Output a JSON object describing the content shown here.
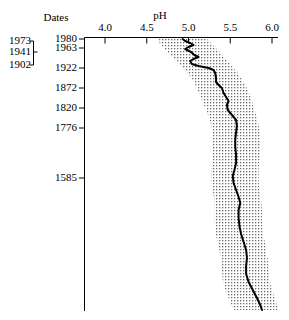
{
  "figure": {
    "dates_header": "Dates",
    "ph_axis_title": "pH"
  },
  "chart_data": {
    "type": "line",
    "title": "pH",
    "xlabel": "pH",
    "ylabel": "Dates",
    "xlim": [
      3.8,
      6.1
    ],
    "ylim_depth_px": [
      37,
      311
    ],
    "grid": false,
    "legend": null,
    "x_ticks": [
      4.0,
      4.5,
      5.0,
      5.5,
      6.0
    ],
    "x_tick_labels": [
      "4.0",
      "4.5",
      "5.0",
      "5.5",
      "6.0"
    ],
    "y_tick_labels": [
      "1980",
      "1963",
      "1922",
      "1872",
      "1820",
      "1776",
      "1585"
    ],
    "y_tick_positions_px": [
      39,
      48,
      68,
      88,
      108,
      128,
      178
    ],
    "bracket_labels": [
      "1973",
      "1941",
      "1902"
    ],
    "bracket_label_positions_px": [
      41,
      52,
      65
    ],
    "series": [
      {
        "name": "reconstructed pH",
        "points": [
          [
            4.93,
            39
          ],
          [
            4.96,
            41
          ],
          [
            5.02,
            43
          ],
          [
            5.06,
            45
          ],
          [
            5.0,
            47
          ],
          [
            4.96,
            49
          ],
          [
            5.03,
            52
          ],
          [
            5.07,
            55
          ],
          [
            5.12,
            57
          ],
          [
            5.06,
            59
          ],
          [
            5.02,
            61
          ],
          [
            5.04,
            64
          ],
          [
            5.12,
            66
          ],
          [
            5.24,
            68
          ],
          [
            5.3,
            70
          ],
          [
            5.32,
            73
          ],
          [
            5.33,
            78
          ],
          [
            5.33,
            82
          ],
          [
            5.36,
            85
          ],
          [
            5.4,
            88
          ],
          [
            5.42,
            93
          ],
          [
            5.45,
            97
          ],
          [
            5.48,
            101
          ],
          [
            5.46,
            105
          ],
          [
            5.47,
            110
          ],
          [
            5.52,
            115
          ],
          [
            5.57,
            120
          ],
          [
            5.58,
            126
          ],
          [
            5.57,
            132
          ],
          [
            5.56,
            139
          ],
          [
            5.56,
            147
          ],
          [
            5.57,
            155
          ],
          [
            5.57,
            163
          ],
          [
            5.55,
            170
          ],
          [
            5.53,
            176
          ],
          [
            5.54,
            183
          ],
          [
            5.57,
            190
          ],
          [
            5.6,
            197
          ],
          [
            5.62,
            203
          ],
          [
            5.6,
            210
          ],
          [
            5.6,
            218
          ],
          [
            5.61,
            226
          ],
          [
            5.63,
            234
          ],
          [
            5.66,
            242
          ],
          [
            5.69,
            250
          ],
          [
            5.7,
            258
          ],
          [
            5.69,
            266
          ],
          [
            5.69,
            274
          ],
          [
            5.72,
            282
          ],
          [
            5.77,
            290
          ],
          [
            5.82,
            298
          ],
          [
            5.86,
            305
          ],
          [
            5.88,
            310
          ]
        ]
      }
    ],
    "band": {
      "name": "error band",
      "lower": [
        [
          4.63,
          39
        ],
        [
          4.66,
          44
        ],
        [
          4.72,
          50
        ],
        [
          4.8,
          56
        ],
        [
          4.86,
          62
        ],
        [
          4.94,
          68
        ],
        [
          5.0,
          74
        ],
        [
          5.06,
          81
        ],
        [
          5.1,
          88
        ],
        [
          5.14,
          96
        ],
        [
          5.18,
          104
        ],
        [
          5.22,
          112
        ],
        [
          5.26,
          121
        ],
        [
          5.28,
          130
        ],
        [
          5.29,
          140
        ],
        [
          5.29,
          150
        ],
        [
          5.28,
          160
        ],
        [
          5.27,
          170
        ],
        [
          5.27,
          180
        ],
        [
          5.29,
          190
        ],
        [
          5.31,
          200
        ],
        [
          5.31,
          210
        ],
        [
          5.31,
          220
        ],
        [
          5.32,
          230
        ],
        [
          5.34,
          240
        ],
        [
          5.37,
          250
        ],
        [
          5.39,
          260
        ],
        [
          5.4,
          270
        ],
        [
          5.41,
          280
        ],
        [
          5.44,
          290
        ],
        [
          5.49,
          300
        ],
        [
          5.54,
          310
        ]
      ],
      "upper": [
        [
          5.22,
          39
        ],
        [
          5.28,
          44
        ],
        [
          5.35,
          50
        ],
        [
          5.42,
          56
        ],
        [
          5.48,
          62
        ],
        [
          5.54,
          68
        ],
        [
          5.6,
          74
        ],
        [
          5.65,
          81
        ],
        [
          5.7,
          88
        ],
        [
          5.74,
          96
        ],
        [
          5.77,
          104
        ],
        [
          5.8,
          112
        ],
        [
          5.83,
          121
        ],
        [
          5.85,
          130
        ],
        [
          5.86,
          140
        ],
        [
          5.86,
          150
        ],
        [
          5.85,
          160
        ],
        [
          5.84,
          170
        ],
        [
          5.84,
          180
        ],
        [
          5.85,
          190
        ],
        [
          5.87,
          200
        ],
        [
          5.88,
          210
        ],
        [
          5.88,
          220
        ],
        [
          5.89,
          230
        ],
        [
          5.91,
          240
        ],
        [
          5.93,
          250
        ],
        [
          5.95,
          260
        ],
        [
          5.96,
          270
        ],
        [
          5.97,
          280
        ],
        [
          6.0,
          290
        ],
        [
          6.04,
          300
        ],
        [
          6.08,
          310
        ]
      ]
    }
  }
}
